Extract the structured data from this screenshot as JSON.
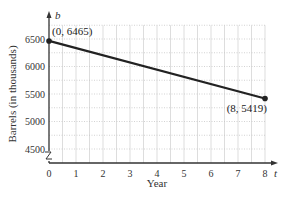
{
  "chart_data": {
    "type": "line",
    "title": "",
    "xlabel": "Year",
    "ylabel": "Barrels (in thousands)",
    "x_var": "t",
    "y_var": "b",
    "xlim": [
      0,
      8
    ],
    "ylim": [
      4500,
      6500
    ],
    "x_ticks": [
      "0",
      "1",
      "2",
      "3",
      "4",
      "5",
      "6",
      "7",
      "8"
    ],
    "y_ticks": [
      "4500",
      "5000",
      "5500",
      "6000",
      "6500"
    ],
    "grid": true,
    "axis_break": "y",
    "series": [
      {
        "name": "barrels",
        "x": [
          0,
          8
        ],
        "values": [
          6465,
          5419
        ],
        "color": "#222222"
      }
    ],
    "annotations": [
      {
        "text": "(0, 6465)",
        "x": 0,
        "y": 6465
      },
      {
        "text": "(8, 5419)",
        "x": 8,
        "y": 5419
      }
    ]
  }
}
